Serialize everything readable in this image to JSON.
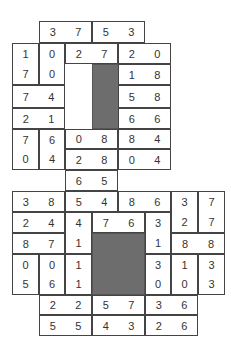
{
  "puzzle": {
    "type": "domino-grid",
    "colors": {
      "border": "#444444",
      "block": "#6d6d6d",
      "text": "#333333",
      "background": "#ffffff"
    },
    "dominoes": [
      {
        "x": 39,
        "y": 21,
        "w": 53,
        "h": 22,
        "o": "h",
        "a": "3",
        "b": "7"
      },
      {
        "x": 92,
        "y": 21,
        "w": 53,
        "h": 22,
        "o": "h",
        "a": "5",
        "b": "3"
      },
      {
        "x": 12,
        "y": 43,
        "w": 27,
        "h": 42,
        "o": "v",
        "a": "1",
        "b": "7"
      },
      {
        "x": 39,
        "y": 43,
        "w": 26,
        "h": 42,
        "o": "v",
        "a": "0",
        "b": "0"
      },
      {
        "x": 65,
        "y": 43,
        "w": 53,
        "h": 21,
        "o": "h",
        "a": "2",
        "b": "7"
      },
      {
        "x": 118,
        "y": 43,
        "w": 53,
        "h": 21,
        "o": "h",
        "a": "2",
        "b": "0"
      },
      {
        "x": 118,
        "y": 64,
        "w": 53,
        "h": 21,
        "o": "h",
        "a": "1",
        "b": "8"
      },
      {
        "x": 12,
        "y": 85,
        "w": 53,
        "h": 23,
        "o": "h",
        "a": "7",
        "b": "4"
      },
      {
        "x": 118,
        "y": 85,
        "w": 53,
        "h": 23,
        "o": "h",
        "a": "5",
        "b": "8"
      },
      {
        "x": 12,
        "y": 108,
        "w": 53,
        "h": 21,
        "o": "h",
        "a": "2",
        "b": "1"
      },
      {
        "x": 118,
        "y": 108,
        "w": 53,
        "h": 21,
        "o": "h",
        "a": "6",
        "b": "6"
      },
      {
        "x": 12,
        "y": 129,
        "w": 27,
        "h": 41,
        "o": "v",
        "a": "7",
        "b": "0"
      },
      {
        "x": 39,
        "y": 129,
        "w": 26,
        "h": 41,
        "o": "v",
        "a": "6",
        "b": "4"
      },
      {
        "x": 65,
        "y": 129,
        "w": 53,
        "h": 20,
        "o": "h",
        "a": "0",
        "b": "8"
      },
      {
        "x": 118,
        "y": 129,
        "w": 53,
        "h": 20,
        "o": "h",
        "a": "8",
        "b": "4"
      },
      {
        "x": 65,
        "y": 149,
        "w": 53,
        "h": 21,
        "o": "h",
        "a": "2",
        "b": "8"
      },
      {
        "x": 118,
        "y": 149,
        "w": 53,
        "h": 21,
        "o": "h",
        "a": "0",
        "b": "4"
      },
      {
        "x": 65,
        "y": 170,
        "w": 53,
        "h": 21,
        "o": "h",
        "a": "6",
        "b": "5"
      },
      {
        "x": 12,
        "y": 191,
        "w": 53,
        "h": 21,
        "o": "h",
        "a": "3",
        "b": "8"
      },
      {
        "x": 65,
        "y": 191,
        "w": 53,
        "h": 21,
        "o": "h",
        "a": "5",
        "b": "4"
      },
      {
        "x": 118,
        "y": 191,
        "w": 53,
        "h": 21,
        "o": "h",
        "a": "8",
        "b": "6"
      },
      {
        "x": 171,
        "y": 191,
        "w": 27,
        "h": 42,
        "o": "v",
        "a": "3",
        "b": "2"
      },
      {
        "x": 198,
        "y": 191,
        "w": 27,
        "h": 42,
        "o": "v",
        "a": "7",
        "b": "7"
      },
      {
        "x": 12,
        "y": 212,
        "w": 53,
        "h": 21,
        "o": "h",
        "a": "2",
        "b": "4"
      },
      {
        "x": 65,
        "y": 212,
        "w": 27,
        "h": 42,
        "o": "v",
        "a": "4",
        "b": "1"
      },
      {
        "x": 92,
        "y": 212,
        "w": 53,
        "h": 21,
        "o": "h",
        "a": "7",
        "b": "6"
      },
      {
        "x": 145,
        "y": 212,
        "w": 26,
        "h": 42,
        "o": "v",
        "a": "3",
        "b": "1"
      },
      {
        "x": 12,
        "y": 233,
        "w": 53,
        "h": 21,
        "o": "h",
        "a": "8",
        "b": "7"
      },
      {
        "x": 171,
        "y": 233,
        "w": 54,
        "h": 21,
        "o": "h",
        "a": "8",
        "b": "8"
      },
      {
        "x": 12,
        "y": 254,
        "w": 27,
        "h": 41,
        "o": "v",
        "a": "0",
        "b": "5"
      },
      {
        "x": 39,
        "y": 254,
        "w": 26,
        "h": 41,
        "o": "v",
        "a": "0",
        "b": "6"
      },
      {
        "x": 65,
        "y": 254,
        "w": 27,
        "h": 41,
        "o": "v",
        "a": "1",
        "b": "1"
      },
      {
        "x": 145,
        "y": 254,
        "w": 26,
        "h": 41,
        "o": "v",
        "a": "3",
        "b": "0"
      },
      {
        "x": 171,
        "y": 254,
        "w": 27,
        "h": 41,
        "o": "v",
        "a": "1",
        "b": "0"
      },
      {
        "x": 198,
        "y": 254,
        "w": 27,
        "h": 41,
        "o": "v",
        "a": "3",
        "b": "3"
      },
      {
        "x": 39,
        "y": 295,
        "w": 53,
        "h": 20,
        "o": "h",
        "a": "2",
        "b": "2"
      },
      {
        "x": 92,
        "y": 295,
        "w": 53,
        "h": 20,
        "o": "h",
        "a": "5",
        "b": "7"
      },
      {
        "x": 145,
        "y": 295,
        "w": 53,
        "h": 20,
        "o": "h",
        "a": "3",
        "b": "6"
      },
      {
        "x": 39,
        "y": 315,
        "w": 53,
        "h": 21,
        "o": "h",
        "a": "5",
        "b": "5"
      },
      {
        "x": 92,
        "y": 315,
        "w": 53,
        "h": 21,
        "o": "h",
        "a": "4",
        "b": "3"
      },
      {
        "x": 145,
        "y": 315,
        "w": 53,
        "h": 21,
        "o": "h",
        "a": "2",
        "b": "6"
      }
    ],
    "blocks": [
      {
        "x": 92,
        "y": 64,
        "w": 53,
        "h": 65
      },
      {
        "x": 92,
        "y": 233,
        "w": 53,
        "h": 62
      }
    ]
  }
}
